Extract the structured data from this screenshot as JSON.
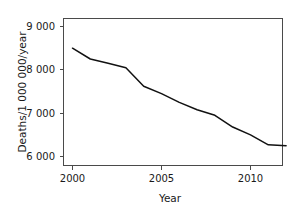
{
  "chart_data": {
    "type": "line",
    "title": "",
    "xlabel": "Year",
    "ylabel": "Deaths/1 000 000/year",
    "x": [
      2000,
      2001,
      2002,
      2003,
      2004,
      2005,
      2006,
      2007,
      2008,
      2009,
      2010,
      2011,
      2012
    ],
    "values": [
      8500,
      8250,
      8150,
      8050,
      7620,
      7450,
      7250,
      7080,
      6950,
      6680,
      6500,
      6270,
      6250
    ],
    "series": [
      {
        "name": "Deaths per million per year",
        "values": [
          8500,
          8250,
          8150,
          8050,
          7620,
          7450,
          7250,
          7080,
          6950,
          6680,
          6500,
          6270,
          6250
        ]
      }
    ],
    "xlim": [
      1999.5,
      2012.3
    ],
    "ylim": [
      5750,
      9150
    ],
    "xticks": [
      2000,
      2005,
      2010
    ],
    "xtick_labels": [
      "2000",
      "2005",
      "2010"
    ],
    "yticks": [
      6000,
      7000,
      8000,
      9000
    ],
    "ytick_labels": [
      "6 000",
      "7 000",
      "8 000",
      "9 000"
    ],
    "grid": false,
    "legend": false,
    "legend_position": "none",
    "line_color": "#111111",
    "axis_color": "#4a4a4a",
    "background_color": "#ffffff"
  },
  "axes": {
    "x_title": "Year",
    "y_title": "Deaths/1 000 000/year",
    "x_tick_labels": [
      "2000",
      "2005",
      "2010"
    ],
    "y_tick_labels": [
      "9 000",
      "8 000",
      "7 000",
      "6 000"
    ]
  }
}
